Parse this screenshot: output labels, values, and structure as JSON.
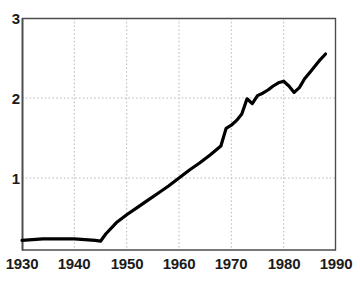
{
  "chart_data": {
    "type": "line",
    "title": "",
    "xlabel": "",
    "ylabel": "",
    "xlim": [
      1930,
      1990
    ],
    "ylim": [
      0,
      3
    ],
    "grid": true,
    "legend": null,
    "xticks": [
      1930,
      1940,
      1950,
      1960,
      1970,
      1980,
      1990
    ],
    "yticks": [
      1,
      2,
      3
    ],
    "xtick_labels": [
      "1930",
      "1940",
      "1950",
      "1960",
      "1970",
      "1980",
      "1990"
    ],
    "ytick_labels": [
      "1",
      "2",
      "3"
    ],
    "series": [
      {
        "name": "series-1",
        "color": "#000000",
        "x": [
          1930,
          1932,
          1934,
          1936,
          1938,
          1940,
          1942,
          1944,
          1945,
          1946,
          1948,
          1950,
          1952,
          1954,
          1956,
          1958,
          1960,
          1962,
          1964,
          1966,
          1968,
          1969,
          1970,
          1971,
          1972,
          1973,
          1974,
          1975,
          1976,
          1977,
          1978,
          1979,
          1980,
          1981,
          1982,
          1983,
          1984,
          1985,
          1986,
          1987,
          1988
        ],
        "y": [
          0.22,
          0.23,
          0.24,
          0.24,
          0.24,
          0.24,
          0.23,
          0.22,
          0.21,
          0.3,
          0.44,
          0.54,
          0.63,
          0.72,
          0.81,
          0.9,
          1.0,
          1.1,
          1.19,
          1.29,
          1.4,
          1.62,
          1.66,
          1.72,
          1.8,
          1.99,
          1.93,
          2.03,
          2.06,
          2.1,
          2.15,
          2.19,
          2.21,
          2.15,
          2.07,
          2.13,
          2.24,
          2.32,
          2.4,
          2.48,
          2.55
        ]
      }
    ]
  },
  "axes": {
    "y_labels": [
      {
        "text": "3",
        "value": 3
      },
      {
        "text": "2",
        "value": 2
      },
      {
        "text": "1",
        "value": 1
      }
    ],
    "x_labels": [
      {
        "text": "1930",
        "value": 1930
      },
      {
        "text": "1940",
        "value": 1940
      },
      {
        "text": "1950",
        "value": 1950
      },
      {
        "text": "1960",
        "value": 1960
      },
      {
        "text": "1970",
        "value": 1970
      },
      {
        "text": "1980",
        "value": 1980
      },
      {
        "text": "1990",
        "value": 1990
      }
    ]
  },
  "style": {
    "line_color": "#000000",
    "axis_color": "#4d4d4d",
    "grid_color": "#b9b9b9",
    "background": "#ffffff",
    "text_color": "#1a1a1a"
  }
}
